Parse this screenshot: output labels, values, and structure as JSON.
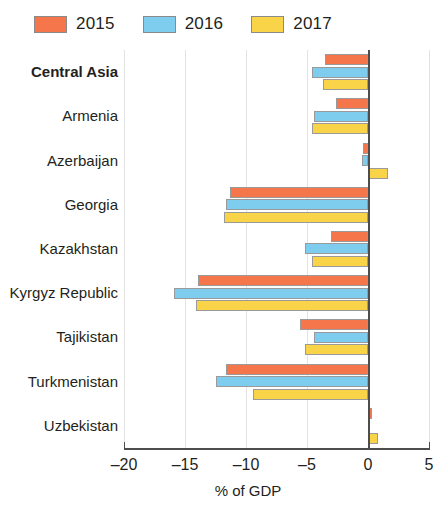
{
  "legend": {
    "entries": [
      {
        "label": "2015",
        "color": "#f4764a"
      },
      {
        "label": "2016",
        "color": "#7fcdee"
      },
      {
        "label": "2017",
        "color": "#f9d348"
      }
    ]
  },
  "axis": {
    "x_title": "% of GDP",
    "ticks": [
      "–20",
      "–15",
      "–10",
      "–5",
      "0",
      "5"
    ],
    "tick_values": [
      -20,
      -15,
      -10,
      -5,
      0,
      5
    ]
  },
  "chart_data": {
    "type": "bar",
    "orientation": "horizontal",
    "title": "",
    "subtitle": "",
    "xlabel": "% of GDP",
    "ylabel": "",
    "xlim": [
      -20,
      5
    ],
    "xticks": [
      -20,
      -15,
      -10,
      -5,
      0,
      5
    ],
    "grid": true,
    "legend_position": "top-left",
    "categories": [
      "Central Asia",
      "Armenia",
      "Azerbaijan",
      "Georgia",
      "Kazakhstan",
      "Kyrgyz Republic",
      "Tajikistan",
      "Turkmenistan",
      "Uzbekistan"
    ],
    "bold_categories": [
      "Central Asia"
    ],
    "series": [
      {
        "name": "2015",
        "color": "#f4764a",
        "values": [
          -3.5,
          -2.6,
          -0.4,
          -11.3,
          -3.0,
          -13.9,
          -5.6,
          -11.6,
          0.3
        ]
      },
      {
        "name": "2016",
        "color": "#7fcdee",
        "values": [
          -4.6,
          -4.4,
          -0.5,
          -11.6,
          -5.2,
          -15.9,
          -4.4,
          -12.5,
          0.0
        ]
      },
      {
        "name": "2017",
        "color": "#f9d348",
        "values": [
          -3.7,
          -4.6,
          1.6,
          -11.8,
          -4.6,
          -14.1,
          -5.2,
          -9.4,
          0.8
        ]
      }
    ]
  }
}
